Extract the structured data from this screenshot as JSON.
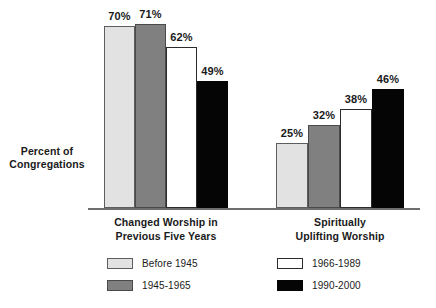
{
  "chart_data": {
    "type": "bar",
    "title": "",
    "xlabel": "",
    "ylabel": "Percent of Congregations",
    "ylim": [
      0,
      80
    ],
    "grid": false,
    "legend_position": "bottom",
    "categories": [
      "Changed Worship in Previous Five Years",
      "Spiritually Uplifting Worship"
    ],
    "series": [
      {
        "name": "Before 1945",
        "color": "#e2e2e2",
        "values": [
          70,
          25
        ],
        "labels": [
          "70%",
          "25%"
        ]
      },
      {
        "name": "1945-1965",
        "color": "#808080",
        "values": [
          71,
          32
        ],
        "labels": [
          "71%",
          "32%"
        ]
      },
      {
        "name": "1966-1989",
        "color": "#ffffff",
        "values": [
          62,
          38
        ],
        "labels": [
          "62%",
          "38%"
        ]
      },
      {
        "name": "1990-2000",
        "color": "#050505",
        "values": [
          49,
          46
        ],
        "labels": [
          "49%",
          "46%"
        ]
      }
    ]
  },
  "axis": {
    "y_label_line1": "Percent of",
    "y_label_line2": "Congregations"
  },
  "groups": [
    {
      "label_line1": "Changed Worship in",
      "label_line2": "Previous Five Years"
    },
    {
      "label_line1": "Spiritually",
      "label_line2": "Uplifting Worship"
    }
  ],
  "legend": {
    "items": [
      {
        "label": "Before 1945",
        "style": "light"
      },
      {
        "label": "1945-1965",
        "style": "mid"
      },
      {
        "label": "1966-1989",
        "style": "white"
      },
      {
        "label": "1990-2000",
        "style": "black"
      }
    ]
  },
  "colors": {
    "light_gray": "#e2e2e2",
    "mid_gray": "#808080",
    "white": "#ffffff",
    "black": "#050505",
    "axis": "#6e6e6e"
  }
}
